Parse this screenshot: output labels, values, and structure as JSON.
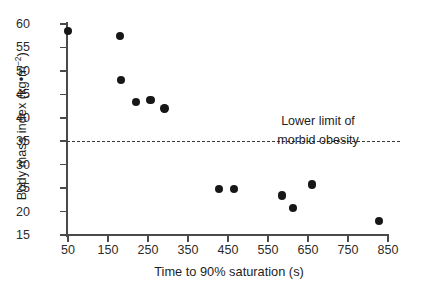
{
  "chart_data": {
    "type": "scatter",
    "title": "",
    "xlabel": "Time to 90% saturation (s)",
    "ylabel": "Body mass index (kg•m−2)",
    "ylabel_base": "Body mass index (kg•m",
    "ylabel_exponent": "−2",
    "ylabel_tail": ")",
    "xlim": [
      50,
      850
    ],
    "ylim": [
      15,
      60
    ],
    "xticks": [
      50,
      150,
      250,
      350,
      450,
      550,
      650,
      750,
      850
    ],
    "yticks": [
      15,
      20,
      25,
      30,
      35,
      40,
      45,
      50,
      55,
      60
    ],
    "xtick_labels": [
      "50",
      "150",
      "250",
      "350",
      "450",
      "550",
      "650",
      "750",
      "850"
    ],
    "ytick_labels": [
      "15",
      "20",
      "25",
      "30",
      "35",
      "40",
      "45",
      "50",
      "55",
      "60"
    ],
    "grid": false,
    "legend": "none",
    "marker": "filled-circle",
    "marker_color": "#171717",
    "points": [
      {
        "x": 50,
        "y": 58.5
      },
      {
        "x": 180,
        "y": 57.5
      },
      {
        "x": 182,
        "y": 48.0
      },
      {
        "x": 220,
        "y": 43.4
      },
      {
        "x": 256,
        "y": 43.8
      },
      {
        "x": 291,
        "y": 42.0
      },
      {
        "x": 428,
        "y": 24.8
      },
      {
        "x": 465,
        "y": 24.8
      },
      {
        "x": 585,
        "y": 23.4
      },
      {
        "x": 612,
        "y": 20.8
      },
      {
        "x": 660,
        "y": 25.8
      },
      {
        "x": 828,
        "y": 18.0
      }
    ],
    "annotations": [
      {
        "name": "morbid-obesity-threshold",
        "line1": "Lower limit of",
        "line2": "morbid obesity",
        "y_value": 35,
        "style": "dashed-horizontal-line"
      }
    ]
  }
}
